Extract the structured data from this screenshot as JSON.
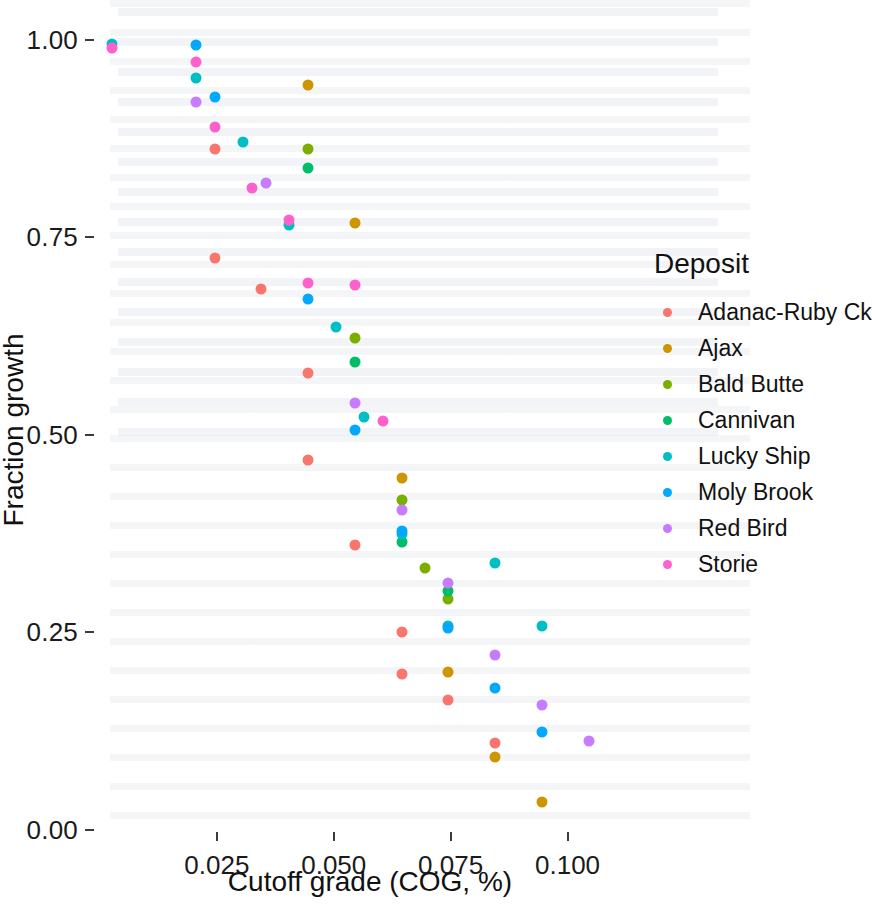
{
  "chart_data": {
    "type": "scatter",
    "title": "",
    "xlabel": "Cutoff grade (COG, %)",
    "ylabel": "Fraction growth",
    "xlim": [
      0.0,
      0.1155
    ],
    "ylim": [
      0.0,
      1.04
    ],
    "xticks": [
      "0.025",
      "0.050",
      "0.075",
      "0.100"
    ],
    "xtick_values": [
      0.025,
      0.05,
      0.075,
      0.1
    ],
    "yticks": [
      "0.00",
      "0.25",
      "0.50",
      "0.75",
      "1.00"
    ],
    "ytick_values": [
      0.0,
      0.25,
      0.5,
      0.75,
      1.0
    ],
    "grid": false,
    "legend_position": "right",
    "legend_title": "Deposit",
    "series": [
      {
        "name": "Adanac-Ruby Ck",
        "color": "#F8766D",
        "points": [
          {
            "x": 0.0245,
            "y": 0.862
          },
          {
            "x": 0.0245,
            "y": 0.724
          },
          {
            "x": 0.0345,
            "y": 0.684
          },
          {
            "x": 0.0445,
            "y": 0.578
          },
          {
            "x": 0.0445,
            "y": 0.468
          },
          {
            "x": 0.0545,
            "y": 0.36
          },
          {
            "x": 0.0645,
            "y": 0.25
          },
          {
            "x": 0.0645,
            "y": 0.198
          },
          {
            "x": 0.0745,
            "y": 0.165
          },
          {
            "x": 0.0845,
            "y": 0.11
          }
        ]
      },
      {
        "name": "Ajax",
        "color": "#CD9600",
        "points": [
          {
            "x": 0.0445,
            "y": 0.942
          },
          {
            "x": 0.0545,
            "y": 0.768
          },
          {
            "x": 0.0645,
            "y": 0.445
          },
          {
            "x": 0.0745,
            "y": 0.2
          },
          {
            "x": 0.0845,
            "y": 0.092
          },
          {
            "x": 0.0945,
            "y": 0.035
          }
        ]
      },
      {
        "name": "Bald Butte",
        "color": "#7CAE00",
        "points": [
          {
            "x": 0.0445,
            "y": 0.862
          },
          {
            "x": 0.0545,
            "y": 0.622
          },
          {
            "x": 0.0645,
            "y": 0.418
          },
          {
            "x": 0.0695,
            "y": 0.332
          },
          {
            "x": 0.0745,
            "y": 0.292
          }
        ]
      },
      {
        "name": "Cannivan",
        "color": "#00BE67",
        "points": [
          {
            "x": 0.0445,
            "y": 0.838
          },
          {
            "x": 0.0545,
            "y": 0.592
          },
          {
            "x": 0.0645,
            "y": 0.365
          },
          {
            "x": 0.0745,
            "y": 0.302
          }
        ]
      },
      {
        "name": "Lucky Ship",
        "color": "#00BFC4",
        "points": [
          {
            "x": 0.0025,
            "y": 0.995
          },
          {
            "x": 0.0205,
            "y": 0.952
          },
          {
            "x": 0.0305,
            "y": 0.87
          },
          {
            "x": 0.0405,
            "y": 0.766
          },
          {
            "x": 0.0505,
            "y": 0.636
          },
          {
            "x": 0.0565,
            "y": 0.522
          },
          {
            "x": 0.0645,
            "y": 0.375
          },
          {
            "x": 0.0745,
            "y": 0.258
          },
          {
            "x": 0.0845,
            "y": 0.338
          },
          {
            "x": 0.0945,
            "y": 0.258
          }
        ]
      },
      {
        "name": "Moly Brook",
        "color": "#00A9FF",
        "points": [
          {
            "x": 0.0205,
            "y": 0.993
          },
          {
            "x": 0.0245,
            "y": 0.928
          },
          {
            "x": 0.0445,
            "y": 0.672
          },
          {
            "x": 0.0545,
            "y": 0.506
          },
          {
            "x": 0.0645,
            "y": 0.378
          },
          {
            "x": 0.0745,
            "y": 0.255
          },
          {
            "x": 0.0845,
            "y": 0.18
          },
          {
            "x": 0.0945,
            "y": 0.124
          }
        ]
      },
      {
        "name": "Red Bird",
        "color": "#C77CFF",
        "points": [
          {
            "x": 0.0205,
            "y": 0.921
          },
          {
            "x": 0.0355,
            "y": 0.818
          },
          {
            "x": 0.0545,
            "y": 0.54
          },
          {
            "x": 0.0645,
            "y": 0.405
          },
          {
            "x": 0.0745,
            "y": 0.312
          },
          {
            "x": 0.0845,
            "y": 0.222
          },
          {
            "x": 0.0945,
            "y": 0.158
          },
          {
            "x": 0.1045,
            "y": 0.112
          }
        ]
      },
      {
        "name": "Storie",
        "color": "#FF61CC",
        "points": [
          {
            "x": 0.0025,
            "y": 0.99
          },
          {
            "x": 0.0205,
            "y": 0.972
          },
          {
            "x": 0.0245,
            "y": 0.89
          },
          {
            "x": 0.0325,
            "y": 0.812
          },
          {
            "x": 0.0405,
            "y": 0.772
          },
          {
            "x": 0.0445,
            "y": 0.692
          },
          {
            "x": 0.0545,
            "y": 0.689
          },
          {
            "x": 0.0605,
            "y": 0.518
          }
        ]
      }
    ]
  },
  "axes": {
    "x_title": "Cutoff grade (COG, %)",
    "y_title": "Fraction growth",
    "x_tick_labels": [
      "0.025",
      "0.050",
      "0.075",
      "0.100"
    ],
    "y_tick_labels": [
      "0.00",
      "0.25",
      "0.50",
      "0.75",
      "1.00"
    ]
  },
  "legend": {
    "title": "Deposit",
    "items": [
      {
        "label": "Adanac-Ruby Ck",
        "color": "#F8766D"
      },
      {
        "label": "Ajax",
        "color": "#CD9600"
      },
      {
        "label": "Bald Butte",
        "color": "#7CAE00"
      },
      {
        "label": "Cannivan",
        "color": "#00BE67"
      },
      {
        "label": "Lucky Ship",
        "color": "#00BFC4"
      },
      {
        "label": "Moly Brook",
        "color": "#00A9FF"
      },
      {
        "label": "Red Bird",
        "color": "#C77CFF"
      },
      {
        "label": "Storie",
        "color": "#FF61CC"
      }
    ]
  }
}
